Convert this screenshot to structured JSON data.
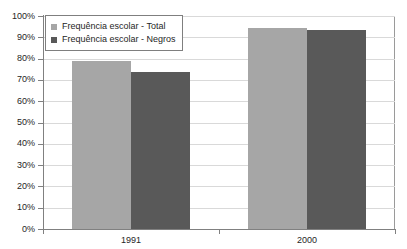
{
  "chart_data": {
    "type": "bar",
    "title": "",
    "subtitle": "",
    "xlabel": "",
    "ylabel": "",
    "categories": [
      "1991",
      "2000"
    ],
    "series": [
      {
        "name": "Frequência escolar - Total",
        "color": "#a6a6a6",
        "values": [
          79,
          94.5
        ]
      },
      {
        "name": "Frequência escolar - Negros",
        "color": "#595959",
        "values": [
          73.5,
          93.5
        ]
      }
    ],
    "ylim": [
      0,
      100
    ],
    "ytick_values": [
      0,
      10,
      20,
      30,
      40,
      50,
      60,
      70,
      80,
      90,
      100
    ],
    "ytick_labels": [
      "0%",
      "10%",
      "20%",
      "30%",
      "40%",
      "50%",
      "60%",
      "70%",
      "80%",
      "90%",
      "100%"
    ],
    "value_suffix": "%",
    "grid": true,
    "grid_axis": "y",
    "legend_position": "top-left",
    "legend_border": true,
    "plot_background": "#ffffff",
    "gridline_color": "#d9d9d9",
    "axis_color": "#808080"
  },
  "legend": {
    "entries": [
      {
        "label": "Frequência escolar - Total",
        "swatch": "legend-swatch-total"
      },
      {
        "label": "Frequência escolar - Negros",
        "swatch": "legend-swatch-negros"
      }
    ]
  },
  "axes": {
    "y": {
      "labels": [
        "100%",
        "90%",
        "80%",
        "70%",
        "60%",
        "50%",
        "40%",
        "30%",
        "20%",
        "10%",
        "0%"
      ]
    },
    "x": {
      "labels": [
        "1991",
        "2000"
      ]
    }
  }
}
